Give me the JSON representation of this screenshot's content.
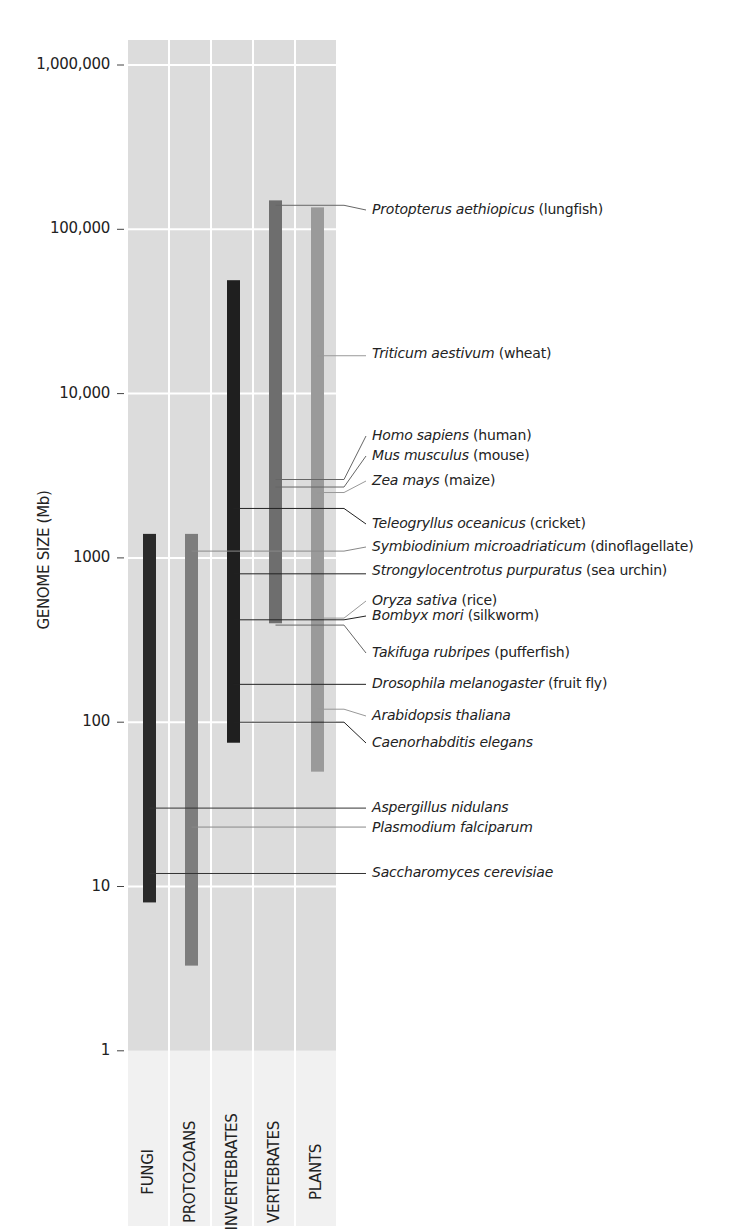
{
  "chart_data": {
    "type": "range-bar",
    "title": "",
    "ylabel": "GENOME SIZE (Mb)",
    "yscale": "log",
    "ylim": [
      1,
      1000000
    ],
    "y_ticks": [
      "1",
      "10",
      "100",
      "1000",
      "10,000",
      "100,000",
      "1,000,000"
    ],
    "y_tick_values": [
      1,
      10,
      100,
      1000,
      10000,
      100000,
      1000000
    ],
    "categories": [
      "FUNGI",
      "PROTOZOANS",
      "INVERTEBRATES",
      "VERTEBRATES",
      "PLANTS"
    ],
    "ranges": [
      {
        "category": "FUNGI",
        "min": 8,
        "max": 1400,
        "color": "#2a2a2a"
      },
      {
        "category": "PROTOZOANS",
        "min": 3.3,
        "max": 1400,
        "color": "#7d7d7d"
      },
      {
        "category": "INVERTEBRATES",
        "min": 75,
        "max": 49000,
        "color": "#1f1f1f"
      },
      {
        "category": "VERTEBRATES",
        "min": 400,
        "max": 150000,
        "color": "#6e6e6e"
      },
      {
        "category": "PLANTS",
        "min": 50,
        "max": 136000,
        "color": "#9a9a9a"
      }
    ],
    "annotations": [
      {
        "species": "Protopterus aethiopicus",
        "common": "(lungfish)",
        "category": "VERTEBRATES",
        "value": 140000
      },
      {
        "species": "Triticum aestivum",
        "common": "(wheat)",
        "category": "PLANTS",
        "value": 17000
      },
      {
        "species": "Homo sapiens",
        "common": "(human)",
        "category": "VERTEBRATES",
        "value": 3000
      },
      {
        "species": "Mus musculus",
        "common": "(mouse)",
        "category": "VERTEBRATES",
        "value": 2700
      },
      {
        "species": "Zea mays",
        "common": "(maize)",
        "category": "PLANTS",
        "value": 2500
      },
      {
        "species": "Teleogryllus oceanicus",
        "common": "(cricket)",
        "category": "INVERTEBRATES",
        "value": 2000
      },
      {
        "species": "Symbiodinium microadriaticum",
        "common": "(dinoflagellate)",
        "category": "PROTOZOANS",
        "value": 1100
      },
      {
        "species": "Strongylocentrotus purpuratus",
        "common": "(sea urchin)",
        "category": "INVERTEBRATES",
        "value": 800
      },
      {
        "species": "Oryza sativa",
        "common": "(rice)",
        "category": "PLANTS",
        "value": 430
      },
      {
        "species": "Bombyx mori",
        "common": "(silkworm)",
        "category": "INVERTEBRATES",
        "value": 420
      },
      {
        "species": "Takifuga rubripes",
        "common": "(pufferfish)",
        "category": "VERTEBRATES",
        "value": 390
      },
      {
        "species": "Drosophila melanogaster",
        "common": "(fruit fly)",
        "category": "INVERTEBRATES",
        "value": 170
      },
      {
        "species": "Arabidopsis thaliana",
        "common": "",
        "category": "PLANTS",
        "value": 120
      },
      {
        "species": "Caenorhabditis elegans",
        "common": "",
        "category": "INVERTEBRATES",
        "value": 100
      },
      {
        "species": "Aspergillus nidulans",
        "common": "",
        "category": "FUNGI",
        "value": 30
      },
      {
        "species": "Plasmodium falciparum",
        "common": "",
        "category": "PROTOZOANS",
        "value": 23
      },
      {
        "species": "Saccharomyces cerevisiae",
        "common": "",
        "category": "FUNGI",
        "value": 12
      }
    ],
    "grid": true,
    "legend": "none"
  }
}
